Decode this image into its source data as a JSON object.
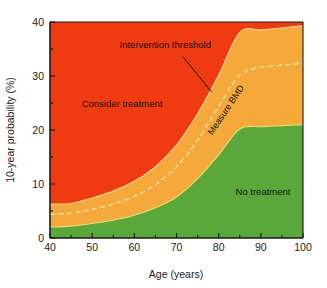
{
  "chart_data": {
    "type": "area",
    "title": "",
    "subtitle": "",
    "xlabel": "Age (years)",
    "ylabel": "10-year probability (%)",
    "xlim": [
      40,
      100
    ],
    "ylim": [
      0,
      40
    ],
    "xticks": [
      40,
      50,
      60,
      70,
      80,
      90,
      100
    ],
    "xticklabels": [
      "40",
      "50",
      "60",
      "70",
      "80",
      "90",
      "100"
    ],
    "xminorticks": [
      45,
      55,
      65,
      75,
      85,
      95
    ],
    "yticks": [
      0,
      10,
      20,
      30,
      40
    ],
    "yticklabels": [
      "0",
      "10",
      "20",
      "30",
      "40"
    ],
    "yminorticks": [
      5,
      15,
      25,
      35
    ],
    "grid": false,
    "legend": "none",
    "colors": {
      "consider_treatment": "#f03a12",
      "measure_bmd": "#f5a93a",
      "no_treatment": "#5aa83a",
      "intervention_threshold_line": "#fce9b0",
      "axis": "#1b1b1b",
      "text": "#141414",
      "background": "#ffffff"
    },
    "series": [
      {
        "name": "Lower threshold (No treatment / Measure BMD boundary)",
        "description": "Upper edge of green No-treatment region",
        "x": [
          40,
          45,
          50,
          55,
          60,
          65,
          70,
          75,
          80,
          85,
          90,
          95,
          100
        ],
        "values": [
          2.0,
          2.2,
          2.7,
          3.3,
          4.2,
          5.6,
          7.6,
          11.0,
          15.4,
          20.2,
          20.6,
          20.8,
          21.0
        ]
      },
      {
        "name": "Intervention threshold (dashed)",
        "description": "Dashed white line within the orange Measure BMD band",
        "x": [
          40,
          45,
          50,
          55,
          60,
          65,
          70,
          75,
          80,
          85,
          90,
          95,
          100
        ],
        "values": [
          4.4,
          4.6,
          5.3,
          6.3,
          7.7,
          9.9,
          13.2,
          18.1,
          24.4,
          30.2,
          31.6,
          32.0,
          32.4
        ]
      },
      {
        "name": "Upper threshold (Measure BMD / Consider treatment boundary)",
        "description": "Upper edge of orange Measure BMD region",
        "x": [
          40,
          45,
          50,
          55,
          60,
          65,
          70,
          75,
          80,
          85,
          90,
          95,
          100
        ],
        "values": [
          6.3,
          6.4,
          7.4,
          8.7,
          10.5,
          13.2,
          17.2,
          23.0,
          30.2,
          38.1,
          38.5,
          38.9,
          39.3
        ]
      }
    ],
    "regions": [
      {
        "key": "consider_treatment",
        "label": "Consider treatment",
        "color": "#f03a12"
      },
      {
        "key": "measure_bmd",
        "label": "Measure BMD",
        "color": "#f5a93a"
      },
      {
        "key": "no_treatment",
        "label": "No treatment",
        "color": "#5aa83a"
      }
    ],
    "annotations": [
      {
        "name": "intervention-threshold",
        "text": "Intervention threshold",
        "x": 56.5,
        "y": 35.2,
        "rotation": 0
      },
      {
        "name": "consider-treatment",
        "text": "Consider treatment",
        "x": 47.5,
        "y": 24.3,
        "rotation": 0
      },
      {
        "name": "measure-bmd",
        "text": "Measure BMD",
        "x": 78.5,
        "y": 19.0,
        "rotation": -56
      },
      {
        "name": "no-treatment",
        "text": "No treatment",
        "x": 84.0,
        "y": 8.0,
        "rotation": 0
      }
    ],
    "leader_line": {
      "name": "intervention-threshold-leader",
      "from": [
        71.5,
        33.6
      ],
      "to": [
        78.3,
        27.1
      ]
    }
  },
  "axes": {
    "x_title": "Age (years)",
    "y_title": "10-year probability (%)"
  }
}
